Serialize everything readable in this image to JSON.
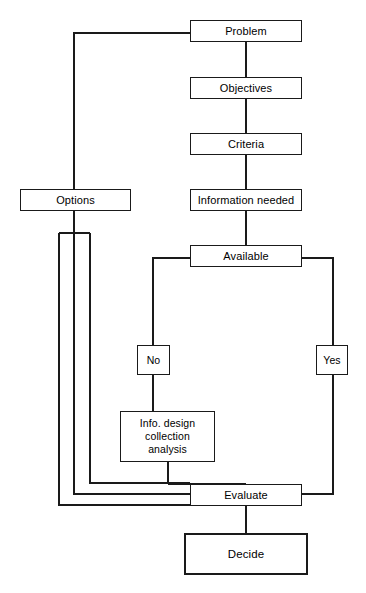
{
  "diagram": {
    "stroke_color": "#1a1a1a",
    "background_color": "#ffffff",
    "nodes": [
      {
        "id": "problem",
        "label": "Problem",
        "x": 190,
        "y": 20,
        "w": 112,
        "h": 22
      },
      {
        "id": "objectives",
        "label": "Objectives",
        "x": 190,
        "y": 77,
        "w": 112,
        "h": 22
      },
      {
        "id": "criteria",
        "label": "Criteria",
        "x": 190,
        "y": 133,
        "w": 112,
        "h": 22
      },
      {
        "id": "information",
        "label": "Information needed",
        "x": 190,
        "y": 189,
        "w": 112,
        "h": 22
      },
      {
        "id": "options",
        "label": "Options",
        "x": 20,
        "y": 189,
        "w": 111,
        "h": 22
      },
      {
        "id": "available",
        "label": "Available",
        "x": 190,
        "y": 245,
        "w": 112,
        "h": 22
      },
      {
        "id": "no",
        "label": "No",
        "x": 137,
        "y": 345,
        "w": 33,
        "h": 30
      },
      {
        "id": "yes",
        "label": "Yes",
        "x": 316,
        "y": 345,
        "w": 32,
        "h": 30
      },
      {
        "id": "evaluate",
        "label": "Evaluate",
        "x": 190,
        "y": 484,
        "w": 112,
        "h": 22
      },
      {
        "id": "decide",
        "label": "Decide",
        "x": 184,
        "y": 533,
        "w": 124,
        "h": 42
      }
    ],
    "multiline_node": {
      "id": "info-design",
      "x": 120,
      "y": 411,
      "w": 95,
      "h": 51,
      "lines": [
        "Info. design",
        "collection",
        "analysis"
      ]
    },
    "edges": [
      {
        "id": "problem-objectives",
        "from": "problem",
        "to": "objectives"
      },
      {
        "id": "objectives-criteria",
        "from": "objectives",
        "to": "criteria"
      },
      {
        "id": "criteria-information",
        "from": "criteria",
        "to": "information"
      },
      {
        "id": "information-available",
        "from": "information",
        "to": "available"
      },
      {
        "id": "problem-options",
        "from": "problem",
        "to": "options",
        "kind": "feedback-left"
      },
      {
        "id": "available-no",
        "from": "available",
        "to": "no",
        "kind": "branch-left"
      },
      {
        "id": "available-yes",
        "from": "available",
        "to": "yes",
        "kind": "branch-right"
      },
      {
        "id": "no-infodesign",
        "from": "no",
        "to": "info-design"
      },
      {
        "id": "infodesign-evaluate",
        "from": "info-design",
        "to": "evaluate"
      },
      {
        "id": "yes-evaluate",
        "from": "yes",
        "to": "evaluate",
        "kind": "return-right"
      },
      {
        "id": "evaluate-options-a",
        "from": "evaluate",
        "to": "options",
        "kind": "return-left-inner"
      },
      {
        "id": "evaluate-options-b",
        "from": "evaluate",
        "to": "options",
        "kind": "return-left-outer"
      },
      {
        "id": "evaluate-decide",
        "from": "evaluate",
        "to": "decide"
      }
    ]
  }
}
